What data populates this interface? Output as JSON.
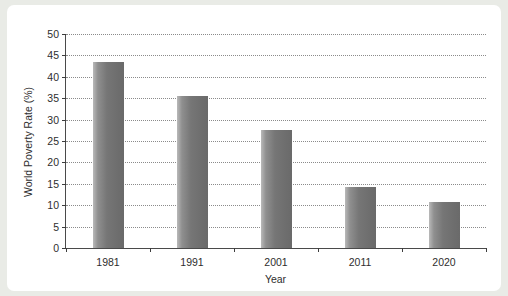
{
  "chart_data": {
    "type": "bar",
    "title": "",
    "xlabel": "Year",
    "ylabel": "World Poverty Rate (%)",
    "categories": [
      "1981",
      "1991",
      "2001",
      "2011",
      "2020"
    ],
    "values": [
      43.5,
      35.5,
      27.5,
      14.3,
      10.7
    ],
    "ylim": [
      0,
      50
    ],
    "ytick_labels": [
      "0",
      "5",
      "10",
      "15",
      "20",
      "25",
      "30",
      "35",
      "40",
      "45",
      "50"
    ],
    "ytick_values": [
      0,
      5,
      10,
      15,
      20,
      25,
      30,
      35,
      40,
      45,
      50
    ],
    "grid": "horizontal-dotted",
    "legend": "none",
    "bar_color": "#7a7a7a",
    "background_color": "#ffffff",
    "axis_color": "#3d3d3d"
  }
}
